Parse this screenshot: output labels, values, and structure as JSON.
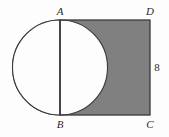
{
  "figure": {
    "background_color": "#fdfdfd",
    "shaded_color": "#808080",
    "unshaded_color": "#fdfdfd",
    "stroke_color": "#3a3a3a",
    "labels": {
      "top_left_vertex": "A",
      "bottom_left_vertex": "B",
      "top_right_vertex": "D",
      "bottom_right_vertex": "C",
      "right_side_length": "8"
    },
    "geometry": {
      "square": {
        "left": 60,
        "top": 20,
        "right": 150,
        "bottom": 115,
        "width": 90,
        "height": 95
      },
      "circle": {
        "center_x": 60,
        "center_y": 67.5,
        "radius": 47.5
      },
      "segment_ab": {
        "x": 60,
        "y1": 20,
        "y2": 115
      }
    }
  }
}
